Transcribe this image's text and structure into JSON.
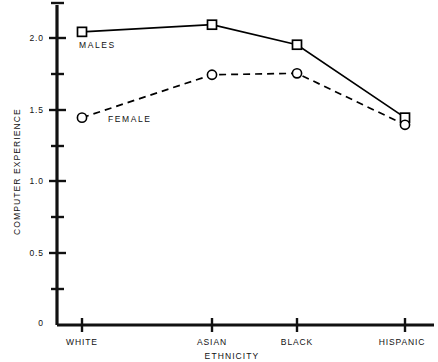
{
  "chart_data": {
    "type": "line",
    "title": "",
    "xlabel": "ETHNICITY",
    "ylabel": "COMPUTER EXPERIENCE",
    "categories": [
      "WHITE",
      "ASIAN",
      "BLACK",
      "HISPANIC"
    ],
    "series": [
      {
        "name": "MALES",
        "values": [
          2.05,
          2.1,
          1.96,
          1.45
        ],
        "marker": "square",
        "linestyle": "solid",
        "color": "#000000"
      },
      {
        "name": "FEMALE",
        "values": [
          1.45,
          1.75,
          1.76,
          1.4
        ],
        "marker": "circle",
        "linestyle": "dashed",
        "color": "#000000"
      }
    ],
    "ylim": [
      0,
      2.3
    ],
    "ymajor_ticks": [
      0,
      0.5,
      1.0,
      1.5,
      2.0
    ],
    "ymajor_tick_labels": [
      "0",
      "0.5",
      "1.0",
      "1.5",
      "2.0"
    ],
    "yminor_ticks": [
      0.25,
      0.75,
      1.25,
      1.75,
      2.25
    ],
    "grid": false,
    "legend": "inline-labels",
    "annotations": [
      {
        "text": "MALES",
        "x_category": "WHITE",
        "y": 1.92
      },
      {
        "text": "FEMALE",
        "x_category": "ASIAN",
        "y": 1.45
      }
    ]
  },
  "axes": {
    "y_ticks": [
      {
        "label": "2.0"
      },
      {
        "label": "1.5"
      },
      {
        "label": "1.0"
      },
      {
        "label": "0.5"
      },
      {
        "label": "0"
      }
    ],
    "x_ticks": [
      {
        "label": "WHITE"
      },
      {
        "label": "ASIAN"
      },
      {
        "label": "BLACK"
      },
      {
        "label": "HISPANIC"
      }
    ],
    "x_title": "ETHNICITY",
    "y_title": "COMPUTER EXPERIENCE"
  },
  "series_labels": {
    "males": "MALES",
    "female": "FEMALE"
  },
  "colors": {
    "axis": "#111111",
    "line": "#000000",
    "background": "#ffffff"
  }
}
